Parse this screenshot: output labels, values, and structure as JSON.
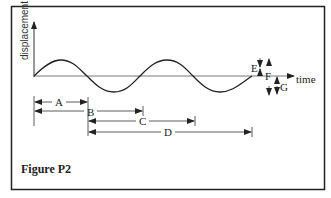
{
  "figure": {
    "caption": "Figure P2",
    "y_axis_label": "displacement",
    "x_axis_label": "time",
    "dimension_labels": {
      "A": "A",
      "B": "B",
      "C": "C",
      "D": "D",
      "E": "E",
      "F": "F",
      "G": "G"
    }
  },
  "colors": {
    "line": "#222222",
    "axis": "#555555",
    "background": "#ffffff"
  }
}
